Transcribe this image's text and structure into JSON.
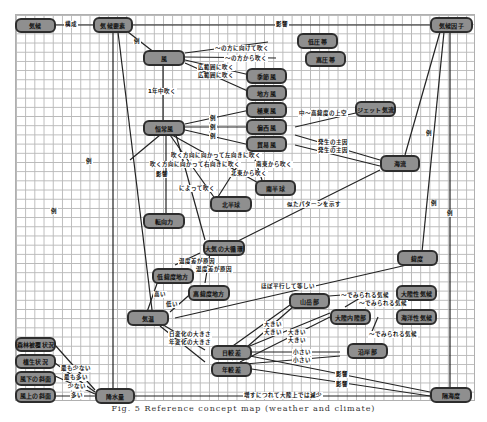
{
  "nodes": {
    "kiko": "気候",
    "kiko_yoso": "気候要素",
    "kiko_inshi": "気候因子",
    "kaze": "風",
    "teiatsutai": "低圧帯",
    "koatsutai": "高圧帯",
    "kisetsufu": "季節風",
    "chihofu": "地方風",
    "kyokutofu": "極東風",
    "henseifu": "偏西風",
    "boekifu": "貿易風",
    "jet_kiryu": "ジェット気流",
    "teishoku": "恒常風",
    "kairyu": "海流",
    "minami_hankyu": "南半球",
    "kita_hankyu": "北半球",
    "tenkoryoku": "転向力",
    "taiki_daijunkan": "大気の大循環",
    "ido": "緯度",
    "tei_ido": "低緯度地方",
    "ko_ido": "高緯度地方",
    "kion": "気温",
    "sangakubu": "山岳部",
    "tairikusei": "大陸性気候",
    "tairiku_naibu": "大陸内陸部",
    "kaiyosei": "海洋性気候",
    "engan": "沿岸部",
    "nichi_kakusa": "日較差",
    "nen_kakusa": "年較差",
    "shinrin": "森林被覆状況",
    "shokusei": "植生状況",
    "kazashita": "風下の斜面",
    "kazakami": "風上の斜面",
    "kosuiryo": "降水量",
    "kaiyodo": "隔海度"
  },
  "edge_labels": {
    "kosei": "構成",
    "eikyo": "影響",
    "rei": "例",
    "hoko_mukete": "～の方に向けて吹く",
    "hoko_kara": "～の方から吹く",
    "kohani_1": "広範囲に吹く",
    "kohani_2": "広範囲に吹く",
    "ichinenju": "1年中吹く",
    "chu_ko_ido": "中～高緯度の上空",
    "hassei_1": "発生の主因",
    "hassei_2": "発生の主因",
    "fuku_hoko_hidari": "吹く方向に向かって左向きに吹く",
    "fuku_hoko_migi": "吹く方向に向かって右向きに吹く",
    "nanto_kara": "南東から吹く",
    "hokuto_kara": "北東から吹く",
    "niyotte": "によって吹く",
    "niru_pattern": "似たパターンを示す",
    "ondo_sa_1": "温度差が原因",
    "ondo_sa_2": "温度差が原因",
    "takai": "高い",
    "hikui": "低い",
    "hobo_heiko": "ほぼ平行して等しい",
    "mirareru_1": "～でみられる気候",
    "mirareru_2": "～でみられる気候",
    "mirareru_3": "～でみられる気候",
    "nichi_henka": "日変化の大きさ",
    "nen_henka": "年変化の大きさ",
    "okii_1": "大きい",
    "okii_2": "大きい",
    "okii_3": "大きい",
    "okii_4": "大きい",
    "chiisai_1": "小さい",
    "chiisai_2": "小さい",
    "mottomo_sukunai": "最も少ない",
    "mottomo_oi": "最も多い",
    "sukunai": "少ない",
    "oi": "多い",
    "zoka_genshou": "増すにつれて大陸上では減少"
  },
  "caption": "Fig. 5  Reference concept map (weather and climate)",
  "colors": {
    "node_fill": "#8f8f8f",
    "node_border": "#2d2d2d",
    "edge": "#222222",
    "grid": "#b8b8b8"
  }
}
